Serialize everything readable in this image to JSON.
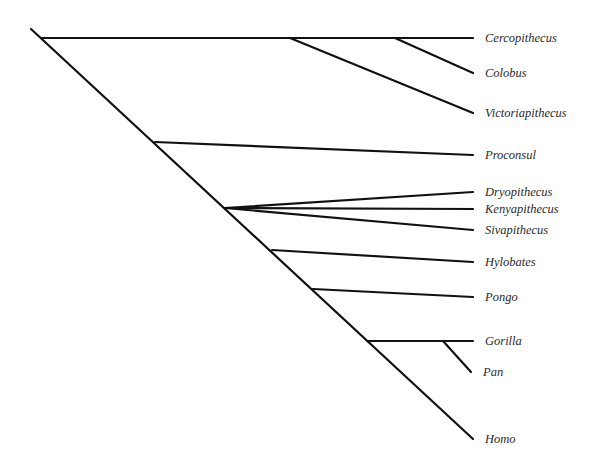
{
  "diagram": {
    "type": "cladogram",
    "line_color": "#111111",
    "label_color": "#2a2a2a",
    "root": {
      "x": 31,
      "y": 29
    },
    "trunk_end": {
      "x": 473,
      "y": 439
    },
    "taxa": [
      {
        "name": "Cercopithecus",
        "tip": {
          "x": 473,
          "y": 38
        }
      },
      {
        "name": "Colobus",
        "tip": {
          "x": 473,
          "y": 73
        }
      },
      {
        "name": "Victoriapithecus",
        "tip": {
          "x": 473,
          "y": 113
        }
      },
      {
        "name": "Proconsul",
        "tip": {
          "x": 473,
          "y": 155
        }
      },
      {
        "name": "Dryopithecus",
        "tip": {
          "x": 473,
          "y": 192
        }
      },
      {
        "name": "Kenyapithecus",
        "tip": {
          "x": 473,
          "y": 209
        }
      },
      {
        "name": "Sivapithecus",
        "tip": {
          "x": 473,
          "y": 230
        }
      },
      {
        "name": "Hylobates",
        "tip": {
          "x": 473,
          "y": 262
        }
      },
      {
        "name": "Pongo",
        "tip": {
          "x": 473,
          "y": 297
        }
      },
      {
        "name": "Gorilla",
        "tip": {
          "x": 473,
          "y": 341
        }
      },
      {
        "name": "Pan",
        "tip": {
          "x": 471,
          "y": 372
        }
      },
      {
        "name": "Homo",
        "tip": {
          "x": 473,
          "y": 439
        }
      }
    ],
    "branches": [
      {
        "id": "old-world-monkey-stem",
        "x1": 42,
        "y1": 38,
        "x2": 473,
        "y2": 38
      },
      {
        "id": "victoriapithecus",
        "x1": 290,
        "y1": 38,
        "x2": 473,
        "y2": 113
      },
      {
        "id": "colobus",
        "x1": 395,
        "y1": 38,
        "x2": 473,
        "y2": 73
      },
      {
        "id": "proconsul",
        "x1": 155,
        "y1": 142,
        "x2": 473,
        "y2": 155
      },
      {
        "id": "dryopithecus",
        "x1": 225,
        "y1": 208,
        "x2": 473,
        "y2": 192
      },
      {
        "id": "kenyapithecus",
        "x1": 225,
        "y1": 208,
        "x2": 473,
        "y2": 209
      },
      {
        "id": "sivapithecus",
        "x1": 225,
        "y1": 208,
        "x2": 473,
        "y2": 230
      },
      {
        "id": "hylobates",
        "x1": 272,
        "y1": 250,
        "x2": 473,
        "y2": 262
      },
      {
        "id": "pongo",
        "x1": 313,
        "y1": 289,
        "x2": 473,
        "y2": 297
      },
      {
        "id": "gorilla",
        "x1": 367,
        "y1": 341,
        "x2": 473,
        "y2": 341
      },
      {
        "id": "pan",
        "x1": 443,
        "y1": 341,
        "x2": 471,
        "y2": 372
      }
    ]
  }
}
